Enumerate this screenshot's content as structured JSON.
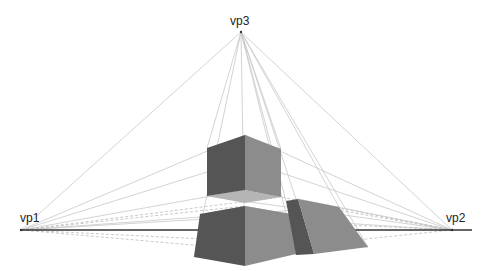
{
  "diagram": {
    "labels": {
      "vp1": "vp1",
      "vp2": "vp2",
      "vp3": "vp3"
    },
    "vanishing_points": {
      "vp1": {
        "x": 21,
        "y": 230
      },
      "vp2": {
        "x": 452,
        "y": 230
      },
      "vp3": {
        "x": 241,
        "y": 32
      }
    },
    "horizon_line": {
      "x1": 20,
      "y1": 230,
      "x2": 472,
      "y2": 230,
      "color": "#333333"
    },
    "colors": {
      "dark_face": "#555555",
      "light_face": "#8c8c8c",
      "top_face": "#b5b5b5",
      "construction_line": "#c8c8c8",
      "dashed_line": "#bbbbbb"
    },
    "shapes": [
      {
        "name": "upper-box",
        "left_face": "207,148 245,135 245,190 207,196",
        "right_face": "245,135 281,149 281,197 245,190",
        "bottom_face": "207,196 245,190 281,197 245,203"
      },
      {
        "name": "lower-box",
        "top_face": "200,214 245,206 291,214 245,220",
        "left_face": "200,214 245,206 245,266 194,257",
        "right_face": "245,206 291,214 296,254 245,266"
      },
      {
        "name": "right-box",
        "dark_face": "286,201 298,199 314,254 296,255",
        "light_face": "298,199 339,207 368,247 314,254"
      }
    ]
  }
}
